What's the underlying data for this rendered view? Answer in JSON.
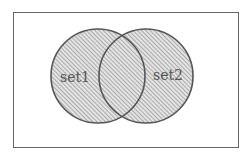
{
  "diagram": {
    "type": "venn",
    "shaded_region": "union",
    "sets": [
      {
        "label": "set1"
      },
      {
        "label": "set2"
      }
    ],
    "colors": {
      "outline": "#555555",
      "hatch": "#777777",
      "border": "#666666"
    }
  }
}
